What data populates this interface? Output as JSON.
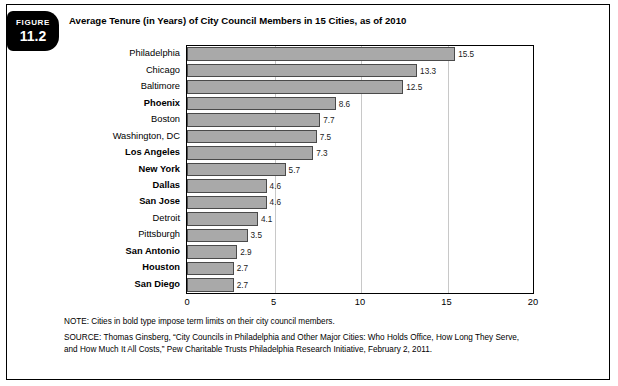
{
  "figure": {
    "badge_word": "FIGURE",
    "badge_number": "11.2",
    "title": "Average Tenure (in Years) of City Council Members in 15 Cities, as of 2010"
  },
  "notes": {
    "note": "NOTE: Cities in bold type impose term limits on their city council members.",
    "source_line1": "SOURCE: Thomas Ginsberg, “City Councils in Philadelphia and Other Major Cities: Who Holds Office, How Long They Serve,",
    "source_line2": "and How Much It All Costs,” Pew Charitable Trusts Philadelphia Research Initiative, February 2, 2011."
  },
  "chart_data": {
    "type": "bar",
    "orientation": "horizontal",
    "title": "Average Tenure (in Years) of City Council Members in 15 Cities, as of 2010",
    "xlabel": "",
    "ylabel": "",
    "xlim": [
      0,
      20
    ],
    "xticks": [
      "0",
      "5",
      "10",
      "15",
      "20"
    ],
    "grid": true,
    "legend": false,
    "bar_color": "#a9a9a9",
    "bar_border_color": "#4a4a4a",
    "categories": [
      "Philadelphia",
      "Chicago",
      "Baltimore",
      "Phoenix",
      "Boston",
      "Washington, DC",
      "Los Angeles",
      "New York",
      "Dallas",
      "San Jose",
      "Detroit",
      "Pittsburgh",
      "San Antonio",
      "Houston",
      "San Diego"
    ],
    "bold_categories": [
      "Phoenix",
      "Los Angeles",
      "New York",
      "Dallas",
      "San Jose",
      "San Antonio",
      "Houston",
      "San Diego"
    ],
    "values": [
      15.5,
      13.3,
      12.5,
      8.6,
      7.7,
      7.5,
      7.3,
      5.7,
      4.6,
      4.6,
      4.1,
      3.5,
      2.9,
      2.7,
      2.7
    ],
    "value_labels": [
      "15.5",
      "13.3",
      "12.5",
      "8.6",
      "7.7",
      "7.5",
      "7.3",
      "5.7",
      "4.6",
      "4.6",
      "4.1",
      "3.5",
      "2.9",
      "2.7",
      "2.7"
    ]
  }
}
